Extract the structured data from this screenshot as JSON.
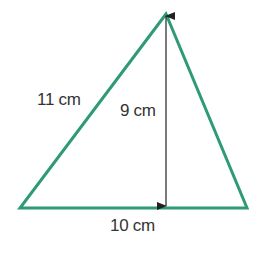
{
  "diagram": {
    "type": "triangle",
    "stroke_color": "#2e9a78",
    "height_line_color": "#222222",
    "vertices": {
      "apex": [
        166,
        14
      ],
      "bottom_left": [
        20,
        208
      ],
      "bottom_right": [
        247,
        208
      ]
    },
    "labels": {
      "left_side": "11 cm",
      "height": "9 cm",
      "base": "10 cm"
    }
  }
}
